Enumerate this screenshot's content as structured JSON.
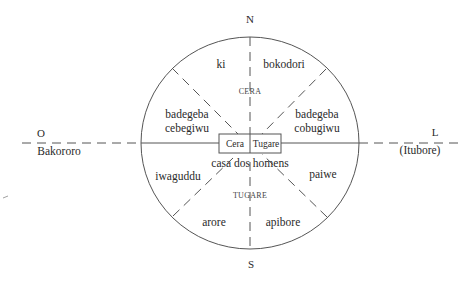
{
  "diagram": {
    "directions": {
      "north": "N",
      "south": "S",
      "west": "O",
      "east": "L"
    },
    "outer_labels": {
      "west": "Bakororo",
      "east": "(Itubore)"
    },
    "halves": {
      "north": "CERA",
      "south": "TUGARE"
    },
    "center": {
      "house": "casa dos homens",
      "box_left": "Cera",
      "box_right": "Tugare"
    },
    "clans": {
      "top_left": "ki",
      "top_right": "bokodori",
      "upper_left": [
        "badegeba",
        "cebegiwu"
      ],
      "upper_right": [
        "badegeba",
        "cobugiwu"
      ],
      "lower_left": "iwaguddu",
      "lower_right": "paiwe",
      "bottom_left": "arore",
      "bottom_right": "apibore"
    },
    "colors": {
      "line": "#555555",
      "text": "#2a2a2a",
      "background": "#ffffff"
    }
  }
}
